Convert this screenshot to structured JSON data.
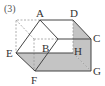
{
  "figure": {
    "number_label": "(3)",
    "colors": {
      "line": "#444444",
      "dashed": "#9a9a9a",
      "shade": "#c4c4c4",
      "label": "#333333"
    },
    "points": {
      "A": {
        "x": 40,
        "y": 20,
        "label": "A",
        "lx": 36,
        "ly": 17
      },
      "D": {
        "x": 73,
        "y": 20,
        "label": "D",
        "lx": 70,
        "ly": 17
      },
      "C": {
        "x": 91,
        "y": 39,
        "label": "C",
        "lx": 93,
        "ly": 42
      },
      "B": {
        "x": 58,
        "y": 39,
        "label": "B",
        "lx": 42,
        "ly": 52
      },
      "E": {
        "x": 16,
        "y": 53,
        "label": "E",
        "lx": 6,
        "ly": 57
      },
      "F": {
        "x": 35,
        "y": 71,
        "label": "F",
        "lx": 31,
        "ly": 84
      },
      "G": {
        "x": 91,
        "y": 71,
        "label": "G",
        "lx": 93,
        "ly": 75
      },
      "H": {
        "x": 73,
        "y": 53,
        "label": "H",
        "lx": 74,
        "ly": 55
      }
    }
  }
}
